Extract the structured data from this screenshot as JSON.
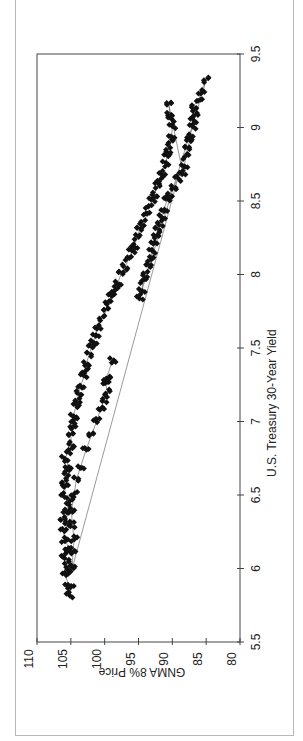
{
  "chart_data": {
    "type": "scatter",
    "title": "",
    "xlabel": "U.S. Treasury 30-Year Yield",
    "ylabel": "GNMA 8% Price",
    "xlim": [
      5.5,
      9.5
    ],
    "ylim": [
      80,
      110
    ],
    "x_ticks": [
      "5.5",
      "6",
      "6.5",
      "7",
      "7.5",
      "8",
      "8.5",
      "9",
      "9.5"
    ],
    "y_ticks": [
      "110",
      "105",
      "100",
      "95",
      "90",
      "85",
      "80"
    ],
    "grid": false,
    "legend": null,
    "orientation_note": "figure rendered rotated 90 degrees counterclockwise",
    "marker": "diamond",
    "connected": true,
    "series": [
      {
        "name": "GNMA 8% Price vs 30Y Yield",
        "points": [
          [
            5.82,
            105.2
          ],
          [
            5.86,
            105.0
          ],
          [
            5.9,
            105.4
          ],
          [
            5.95,
            105.8
          ],
          [
            6.0,
            105.3
          ],
          [
            6.05,
            105.6
          ],
          [
            6.1,
            106.0
          ],
          [
            6.15,
            105.4
          ],
          [
            6.2,
            105.9
          ],
          [
            6.25,
            106.1
          ],
          [
            6.3,
            105.5
          ],
          [
            6.35,
            106.2
          ],
          [
            6.4,
            105.7
          ],
          [
            6.45,
            105.2
          ],
          [
            6.5,
            106.0
          ],
          [
            6.55,
            105.8
          ],
          [
            6.6,
            106.0
          ],
          [
            6.65,
            105.6
          ],
          [
            6.7,
            105.4
          ],
          [
            6.75,
            105.9
          ],
          [
            6.8,
            105.2
          ],
          [
            6.85,
            104.9
          ],
          [
            6.9,
            105.0
          ],
          [
            6.95,
            104.7
          ],
          [
            7.0,
            104.5
          ],
          [
            7.05,
            104.6
          ],
          [
            7.1,
            104.2
          ],
          [
            7.15,
            104.0
          ],
          [
            7.2,
            103.8
          ],
          [
            7.25,
            103.5
          ],
          [
            7.3,
            103.1
          ],
          [
            7.35,
            102.9
          ],
          [
            7.4,
            102.7
          ],
          [
            7.45,
            102.3
          ],
          [
            7.5,
            102.0
          ],
          [
            7.55,
            101.6
          ],
          [
            7.6,
            101.3
          ],
          [
            7.65,
            101.0
          ],
          [
            7.7,
            100.4
          ],
          [
            7.75,
            99.8
          ],
          [
            7.8,
            99.5
          ],
          [
            7.85,
            99.0
          ],
          [
            7.9,
            98.5
          ],
          [
            7.95,
            98.0
          ],
          [
            8.0,
            97.6
          ],
          [
            8.05,
            97.0
          ],
          [
            8.1,
            96.5
          ],
          [
            8.15,
            96.0
          ],
          [
            8.2,
            95.6
          ],
          [
            8.25,
            95.2
          ],
          [
            8.3,
            94.9
          ],
          [
            8.35,
            94.4
          ],
          [
            8.4,
            93.8
          ],
          [
            8.45,
            93.5
          ],
          [
            8.5,
            93.0
          ],
          [
            8.55,
            92.6
          ],
          [
            8.6,
            92.2
          ],
          [
            8.65,
            91.8
          ],
          [
            8.7,
            91.5
          ],
          [
            8.75,
            91.0
          ],
          [
            8.8,
            90.8
          ],
          [
            8.85,
            90.6
          ],
          [
            8.9,
            90.3
          ],
          [
            8.95,
            90.1
          ],
          [
            9.0,
            90.0
          ],
          [
            9.05,
            90.2
          ],
          [
            9.1,
            90.4
          ],
          [
            9.15,
            90.5
          ],
          [
            8.7,
            88.5
          ],
          [
            8.75,
            88.2
          ],
          [
            8.8,
            88.0
          ],
          [
            8.85,
            87.8
          ],
          [
            8.9,
            87.5
          ],
          [
            8.95,
            87.4
          ],
          [
            9.0,
            87.0
          ],
          [
            9.05,
            86.9
          ],
          [
            9.1,
            86.6
          ],
          [
            9.15,
            86.8
          ],
          [
            9.2,
            86.0
          ],
          [
            9.25,
            85.7
          ],
          [
            9.32,
            85.0
          ],
          [
            7.85,
            94.8
          ],
          [
            7.9,
            94.5
          ],
          [
            7.95,
            94.3
          ],
          [
            8.0,
            94.0
          ],
          [
            8.05,
            93.5
          ],
          [
            8.1,
            93.2
          ],
          [
            8.15,
            93.0
          ],
          [
            8.2,
            92.7
          ],
          [
            8.25,
            92.4
          ],
          [
            8.3,
            92.2
          ],
          [
            8.35,
            91.8
          ],
          [
            8.4,
            91.5
          ],
          [
            8.45,
            91.2
          ],
          [
            8.5,
            90.8
          ],
          [
            8.55,
            90.4
          ],
          [
            8.6,
            89.8
          ],
          [
            8.65,
            89.2
          ],
          [
            6.0,
            104.8
          ],
          [
            6.1,
            104.7
          ],
          [
            6.2,
            104.5
          ],
          [
            6.3,
            104.8
          ],
          [
            6.4,
            104.9
          ],
          [
            6.5,
            104.5
          ],
          [
            6.6,
            104.2
          ],
          [
            6.7,
            103.5
          ],
          [
            6.8,
            102.8
          ],
          [
            6.9,
            102.0
          ],
          [
            7.0,
            101.2
          ],
          [
            7.1,
            100.5
          ],
          [
            7.15,
            100.0
          ],
          [
            7.2,
            99.6
          ],
          [
            7.25,
            99.8
          ],
          [
            7.28,
            99.5
          ],
          [
            7.3,
            99.7
          ],
          [
            7.42,
            98.8
          ]
        ]
      }
    ]
  },
  "page": {
    "side_caption": "Exhibit: GNMA 8% Price vs. U.S. Treasury 30-Year Yield"
  }
}
